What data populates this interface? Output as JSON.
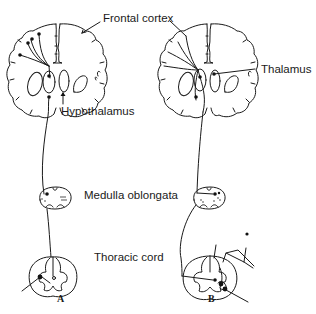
{
  "diagram": {
    "type": "neuroanatomical pathway illustration",
    "panels": [
      {
        "id": "A",
        "label": "A",
        "structures": [
          "cerebral hemispheres (coronal section)",
          "medulla oblongata section",
          "thoracic spinal cord section"
        ],
        "description": "Descending pathway from frontal cortex through hypothalamus to medulla and thoracic cord"
      },
      {
        "id": "B",
        "label": "B",
        "structures": [
          "cerebral hemispheres (coronal section)",
          "medulla oblongata section",
          "thoracic spinal cord section"
        ],
        "description": "Pathway involving thalamus and cortex, with afferent input entering thoracic cord"
      }
    ],
    "labels": {
      "frontal_cortex": "Frontal cortex",
      "thalamus": "Thalamus",
      "hypothalamus": "Hypothalamus",
      "medulla": "Medulla oblongata",
      "thoracic": "Thoracic cord"
    },
    "panel_labels": {
      "a": "A",
      "b": "B"
    }
  }
}
